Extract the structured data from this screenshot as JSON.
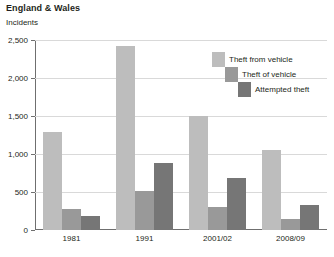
{
  "header": {
    "title": "England & Wales",
    "subtitle": "Incidents"
  },
  "chart_data": {
    "type": "bar",
    "title": "England & Wales",
    "subtitle": "Incidents",
    "xlabel": "",
    "ylabel": "Incidents",
    "ylim": [
      0,
      2500
    ],
    "yticks": [
      "0",
      "500",
      "1,000",
      "1,500",
      "2,000",
      "2,500"
    ],
    "ytick_values": [
      0,
      500,
      1000,
      1500,
      2000,
      2500
    ],
    "grid": true,
    "legend_position": "top-right",
    "categories": [
      "1981",
      "1991",
      "2001/02",
      "2008/09"
    ],
    "series": [
      {
        "name": "Theft from vehicle",
        "color": "#bdbdbd",
        "values": [
          1290,
          2420,
          1500,
          1050
        ]
      },
      {
        "name": "Theft of vehicle",
        "color": "#999999",
        "values": [
          275,
          510,
          300,
          140
        ]
      },
      {
        "name": "Attempted theft",
        "color": "#767676",
        "values": [
          180,
          880,
          680,
          330
        ]
      }
    ]
  }
}
